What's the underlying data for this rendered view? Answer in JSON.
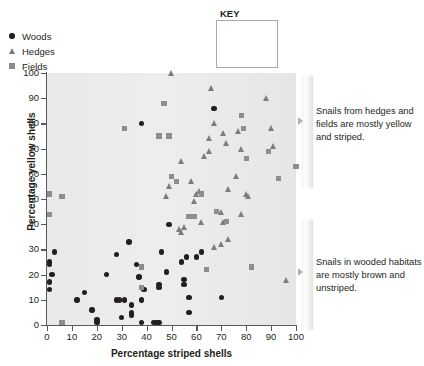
{
  "chart_data": {
    "type": "scatter",
    "title": "",
    "xlabel": "Percentage striped shells",
    "ylabel": "Percentage yellow shells",
    "xlim": [
      0,
      100
    ],
    "ylim": [
      0,
      100
    ],
    "xticks": [
      0,
      10,
      20,
      30,
      40,
      50,
      60,
      70,
      80,
      90,
      100
    ],
    "yticks": [
      0,
      10,
      20,
      30,
      40,
      50,
      60,
      70,
      80,
      90,
      100
    ],
    "grid": false,
    "legend_position": "top-right-outside",
    "legend_title": "KEY",
    "series": [
      {
        "name": "Woods",
        "marker": "circle",
        "color": "#231f20",
        "points": [
          [
            1,
            25
          ],
          [
            1,
            24
          ],
          [
            2,
            20
          ],
          [
            1,
            17
          ],
          [
            1,
            14
          ],
          [
            3,
            29
          ],
          [
            12,
            10
          ],
          [
            15,
            13
          ],
          [
            18,
            6
          ],
          [
            20,
            2
          ],
          [
            20,
            1
          ],
          [
            24,
            20
          ],
          [
            28,
            28
          ],
          [
            28,
            10
          ],
          [
            29,
            10
          ],
          [
            30,
            3
          ],
          [
            31,
            10
          ],
          [
            33,
            33
          ],
          [
            34,
            8
          ],
          [
            34,
            5
          ],
          [
            34,
            4
          ],
          [
            36,
            24
          ],
          [
            37,
            19
          ],
          [
            38,
            10
          ],
          [
            38,
            80
          ],
          [
            38,
            1
          ],
          [
            39,
            14
          ],
          [
            43,
            1
          ],
          [
            44,
            1
          ],
          [
            45,
            1
          ],
          [
            45,
            16
          ],
          [
            45,
            15
          ],
          [
            46,
            29
          ],
          [
            48,
            21
          ],
          [
            49,
            40
          ],
          [
            54,
            25
          ],
          [
            55,
            18
          ],
          [
            55,
            16
          ],
          [
            56,
            27
          ],
          [
            57,
            11
          ],
          [
            57,
            5
          ],
          [
            60,
            27
          ],
          [
            62,
            29
          ],
          [
            67,
            86
          ],
          [
            70,
            11
          ]
        ]
      },
      {
        "name": "Hedges",
        "marker": "triangle",
        "color": "#7d7d7d",
        "points": [
          [
            50,
            100
          ],
          [
            66,
            94
          ],
          [
            88,
            90
          ],
          [
            67,
            80
          ],
          [
            90,
            78
          ],
          [
            71,
            76
          ],
          [
            77,
            77
          ],
          [
            65,
            74
          ],
          [
            78,
            70
          ],
          [
            91,
            71
          ],
          [
            72,
            72
          ],
          [
            65,
            69
          ],
          [
            63,
            67
          ],
          [
            54,
            65
          ],
          [
            49,
            55
          ],
          [
            48,
            51
          ],
          [
            58,
            57
          ],
          [
            60,
            52
          ],
          [
            61,
            53
          ],
          [
            59,
            49
          ],
          [
            73,
            54
          ],
          [
            76,
            59
          ],
          [
            80,
            52
          ],
          [
            81,
            51
          ],
          [
            78,
            44
          ],
          [
            70,
            45
          ],
          [
            71,
            41
          ],
          [
            73,
            34
          ],
          [
            67,
            31
          ],
          [
            70,
            32
          ],
          [
            53,
            38
          ],
          [
            54,
            37
          ],
          [
            55,
            39
          ],
          [
            62,
            41
          ],
          [
            96,
            18
          ]
        ]
      },
      {
        "name": "Fields",
        "marker": "square",
        "color": "#8d8d8d",
        "points": [
          [
            1,
            52
          ],
          [
            1,
            44
          ],
          [
            6,
            51
          ],
          [
            6,
            1
          ],
          [
            31,
            78
          ],
          [
            38,
            23
          ],
          [
            38,
            15
          ],
          [
            45,
            75
          ],
          [
            47,
            88
          ],
          [
            49,
            75
          ],
          [
            50,
            59
          ],
          [
            52,
            57
          ],
          [
            57,
            43
          ],
          [
            59,
            43
          ],
          [
            62,
            52
          ],
          [
            64,
            22
          ],
          [
            68,
            45
          ],
          [
            72,
            41
          ],
          [
            78,
            83
          ],
          [
            79,
            78
          ],
          [
            80,
            66
          ],
          [
            82,
            23
          ],
          [
            89,
            69
          ],
          [
            93,
            58
          ],
          [
            100,
            63
          ]
        ]
      }
    ]
  },
  "legend": {
    "title": "KEY",
    "items": [
      {
        "label": "Woods",
        "symbol": "circle-icon"
      },
      {
        "label": "Hedges",
        "symbol": "triangle-icon"
      },
      {
        "label": "Fields",
        "symbol": "square-icon"
      }
    ]
  },
  "annotations": [
    {
      "text": "Snails from hedges and fields are mostly yellow and striped."
    },
    {
      "text": "Snails in wooded habitats are mostly brown and unstriped."
    }
  ]
}
